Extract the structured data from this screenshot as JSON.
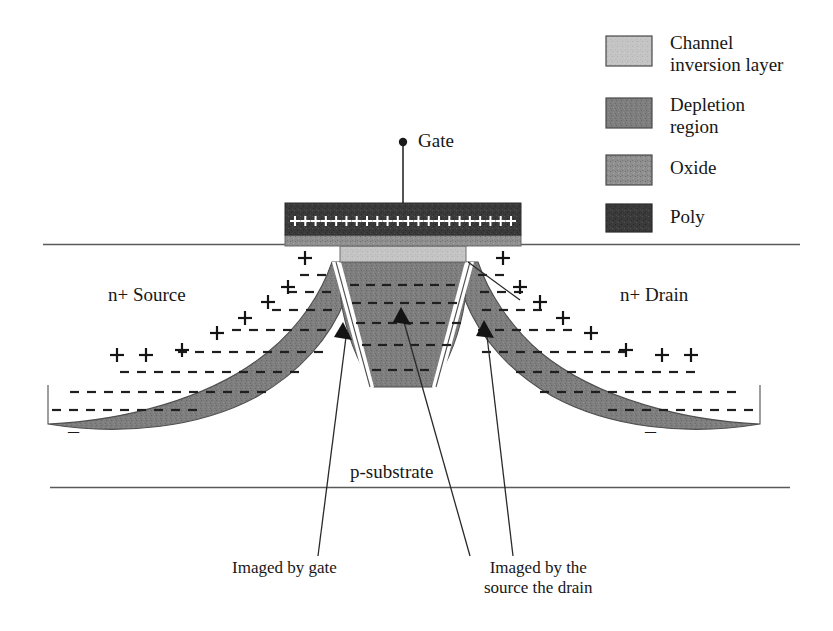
{
  "figure": {
    "background": "#ffffff"
  },
  "colors": {
    "poly": "#3d3d3d",
    "oxide": "#8c8c8c",
    "depletion": "#7d7d7d",
    "channel": "#c2c2c2",
    "line": "#4a4a4a",
    "text": "#171717"
  },
  "legend": {
    "items": [
      {
        "label": "Channel\ninversion layer",
        "swatch": "channel",
        "color": "#c2c2c2"
      },
      {
        "label": "Depletion\nregion",
        "swatch": "depletion",
        "color": "#6f6f6f"
      },
      {
        "label": "Oxide",
        "swatch": "oxide",
        "color": "#8a8a8a"
      },
      {
        "label": "Poly",
        "swatch": "poly",
        "color": "#333333"
      }
    ]
  },
  "device": {
    "gate_terminal": "Gate",
    "source_label": "n+ Source",
    "drain_label": "n+ Drain",
    "substrate_label": "p-substrate",
    "annotation_gate": "Imaged by gate",
    "annotation_sd": "Imaged by the\nsource the drain",
    "left_minus": "–",
    "right_minus": "–",
    "gate_plus_count": 22,
    "boundary_plus_left_count": 7,
    "boundary_plus_right_count": 7
  }
}
